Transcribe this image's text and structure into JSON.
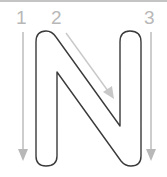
{
  "worksheet": {
    "letter": "N",
    "steps": [
      {
        "number": "1",
        "direction": "down"
      },
      {
        "number": "2",
        "direction": "diagonal-down-right"
      },
      {
        "number": "3",
        "direction": "down"
      }
    ]
  },
  "colors": {
    "outline": "#3a3a3a",
    "arrow": "#b8b8b8",
    "label": "#b8b8b8",
    "border": "#c4c4c4",
    "background": "#ffffff"
  }
}
